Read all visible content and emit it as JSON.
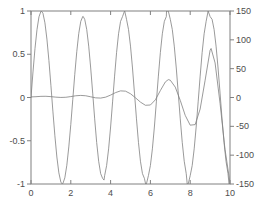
{
  "figure": {
    "background_color": "#ffffff",
    "axes_color": "#808080",
    "line_color": "#808080"
  },
  "chart_data": {
    "type": "line",
    "title": "",
    "xlabel": "",
    "ylabel": "",
    "y2label": "",
    "grid": false,
    "legend": null,
    "dual_axis": true,
    "xlim": [
      0,
      10
    ],
    "ylim": [
      -1,
      1
    ],
    "y2lim": [
      -150,
      150
    ],
    "xticks": [
      0,
      2,
      4,
      6,
      8,
      10
    ],
    "xtick_labels": [
      "0",
      "2",
      "4",
      "6",
      "8",
      "10"
    ],
    "yticks": [
      -1,
      -0.5,
      0,
      0.5,
      1
    ],
    "ytick_labels": [
      "-1",
      "-0.5",
      "0",
      "0.5",
      "1"
    ],
    "y2ticks": [
      -150,
      -100,
      -50,
      0,
      50,
      100,
      150
    ],
    "y2tick_labels": [
      "-150",
      "-100",
      "-50",
      "0",
      "50",
      "100",
      "150"
    ],
    "series": [
      {
        "name": "sin(3x)",
        "axis": "left",
        "color": "#808080",
        "x": [
          0,
          0.1,
          0.2,
          0.3,
          0.4,
          0.5,
          0.52,
          0.6,
          0.7,
          0.8,
          0.9,
          1.0,
          1.1,
          1.2,
          1.3,
          1.4,
          1.5,
          1.57,
          1.6,
          1.7,
          1.8,
          1.9,
          2.0,
          2.1,
          2.2,
          2.3,
          2.4,
          2.5,
          2.6,
          2.62,
          2.7,
          2.8,
          2.9,
          3.0,
          3.1,
          3.2,
          3.3,
          3.4,
          3.5,
          3.6,
          3.67,
          3.7,
          3.8,
          3.9,
          4.0,
          4.1,
          4.2,
          4.3,
          4.4,
          4.5,
          4.6,
          4.7,
          4.71,
          4.8,
          4.9,
          5.0,
          5.1,
          5.2,
          5.3,
          5.4,
          5.5,
          5.6,
          5.7,
          5.76,
          5.8,
          5.9,
          6.0,
          6.1,
          6.2,
          6.3,
          6.4,
          6.5,
          6.6,
          6.7,
          6.8,
          6.81,
          6.9,
          7.0,
          7.1,
          7.2,
          7.3,
          7.4,
          7.5,
          7.6,
          7.7,
          7.8,
          7.85,
          7.9,
          8.0,
          8.1,
          8.2,
          8.3,
          8.4,
          8.5,
          8.6,
          8.7,
          8.8,
          8.9,
          8.9,
          9.0,
          9.1,
          9.2,
          9.3,
          9.4,
          9.5,
          9.6,
          9.7,
          9.8,
          9.9,
          9.95,
          10.0
        ],
        "y": [
          0,
          0.2955,
          0.5646,
          0.7833,
          0.932,
          0.9975,
          1.0,
          0.9738,
          0.8632,
          0.6755,
          0.4274,
          0.1411,
          -0.1577,
          -0.4425,
          -0.6878,
          -0.8716,
          -0.9775,
          -1.0,
          -0.9962,
          -0.9285,
          -0.7833,
          -0.5716,
          -0.3108,
          -0.0221,
          0.2675,
          0.5298,
          0.7403,
          0.8797,
          0.9357,
          0.9375,
          0.9037,
          0.7867,
          0.5939,
          0.3412,
          0.0504,
          -0.247,
          -0.5188,
          -0.7368,
          -0.8797,
          -0.9358,
          -0.9547,
          -0.9037,
          -0.7867,
          -0.5939,
          -0.3412,
          -0.0504,
          0.247,
          0.5188,
          0.7368,
          0.8797,
          0.9358,
          0.9993,
          1.0,
          0.9037,
          0.7867,
          0.5939,
          0.3412,
          0.0504,
          -0.247,
          -0.5188,
          -0.7368,
          -0.8797,
          -0.9358,
          -1.0,
          -0.9993,
          -0.9037,
          -0.7867,
          -0.5939,
          -0.3412,
          -0.0504,
          0.247,
          0.5188,
          0.7368,
          0.8797,
          0.9358,
          1.0,
          0.9993,
          0.9037,
          0.7867,
          0.5939,
          0.3412,
          0.0504,
          -0.247,
          -0.5188,
          -0.7368,
          -0.8797,
          -1.0,
          -0.9993,
          -0.9037,
          -0.7867,
          -0.5939,
          -0.3412,
          -0.0504,
          0.247,
          0.5188,
          0.7368,
          0.8797,
          0.9993,
          1.0,
          0.9358,
          0.9037,
          0.7867,
          0.5939,
          0.3412,
          0.0504,
          -0.247,
          -0.5188,
          -0.7368,
          -0.8797,
          -1.0,
          -0.988
        ]
      },
      {
        "name": "growing oscillation",
        "axis": "right",
        "color": "#808080",
        "x": [
          0,
          0.25,
          0.5,
          0.75,
          1.0,
          1.25,
          1.5,
          1.75,
          2.0,
          2.25,
          2.5,
          2.75,
          3.0,
          3.25,
          3.5,
          3.75,
          4.0,
          4.25,
          4.5,
          4.75,
          5.0,
          5.25,
          5.5,
          5.75,
          6.0,
          6.25,
          6.5,
          6.75,
          6.9,
          7.0,
          7.25,
          7.5,
          7.75,
          8.0,
          8.25,
          8.5,
          8.75,
          9.0,
          9.05,
          9.25,
          9.5,
          9.75,
          10.0
        ],
        "y": [
          1.0,
          1.4,
          2.0,
          2.1,
          1.5,
          0.6,
          0.1,
          0.4,
          1.6,
          3.0,
          3.6,
          3.0,
          1.2,
          -0.6,
          -1.0,
          0.6,
          4.2,
          8.5,
          11.5,
          11.0,
          6.5,
          -0.5,
          -8.0,
          -13.5,
          -13.0,
          -4.0,
          12.0,
          27.0,
          31.0,
          30.0,
          18.0,
          -5.0,
          -31.0,
          -48.0,
          -47.0,
          -20.0,
          30.0,
          82.0,
          85.0,
          60.0,
          -10.0,
          -90.0,
          -148.0
        ]
      }
    ]
  }
}
